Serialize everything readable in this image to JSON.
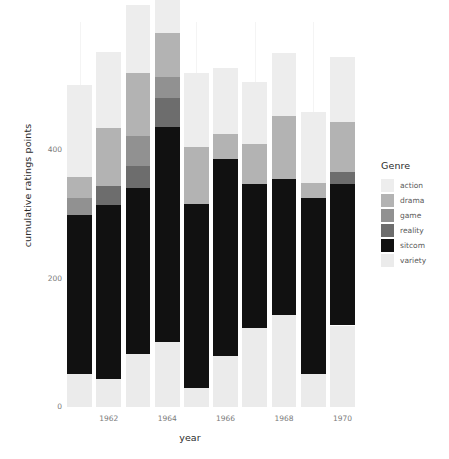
{
  "chart_data": {
    "type": "bar",
    "variant": "stacked",
    "title": "",
    "xlabel": "year",
    "ylabel": "cumulative ratings points",
    "x": [
      1961,
      1962,
      1963,
      1964,
      1965,
      1966,
      1967,
      1968,
      1969,
      1970
    ],
    "categories": [
      "1961",
      "1962",
      "1963",
      "1964",
      "1965",
      "1966",
      "1967",
      "1968",
      "1969",
      "1970"
    ],
    "xtick_labels": [
      "1962",
      "1964",
      "1966",
      "1968",
      "1970"
    ],
    "xtick_values": [
      1962,
      1964,
      1966,
      1968,
      1970
    ],
    "ytick_labels": [
      "0",
      "200",
      "400"
    ],
    "ytick_values": [
      0,
      200,
      400
    ],
    "ylim": [
      0,
      600
    ],
    "xlim": [
      1960.4,
      1970.6
    ],
    "grid": "vertical-minor-only",
    "legend_title": "Genre",
    "legend_position": "right",
    "stack_order_bottom_to_top": [
      "variety",
      "sitcom",
      "reality",
      "game",
      "drama",
      "action"
    ],
    "colors": {
      "action": "#ededed",
      "drama": "#b3b3b3",
      "game": "#919191",
      "reality": "#6d6d6d",
      "sitcom": "#111111",
      "variety": "#ebebeb"
    },
    "series": [
      {
        "name": "action",
        "values": [
          143,
          119,
          106,
          123,
          116,
          103,
          96,
          98,
          111,
          101
        ]
      },
      {
        "name": "drama",
        "values": [
          34,
          91,
          99,
          69,
          89,
          38,
          62,
          99,
          23,
          77
        ]
      },
      {
        "name": "game",
        "values": [
          26,
          0,
          46,
          32,
          0,
          0,
          0,
          0,
          0,
          0
        ]
      },
      {
        "name": "reality",
        "values": [
          0,
          29,
          34,
          46,
          0,
          0,
          0,
          0,
          0,
          20
        ]
      },
      {
        "name": "sitcom",
        "values": [
          247,
          271,
          260,
          335,
          286,
          308,
          225,
          212,
          275,
          220
        ]
      },
      {
        "name": "variety",
        "values": [
          52,
          44,
          82,
          101,
          30,
          79,
          123,
          143,
          51,
          127
        ]
      }
    ],
    "totals": [
      502,
      554,
      627,
      706,
      521,
      528,
      506,
      552,
      460,
      545
    ]
  },
  "legend": {
    "title": "Genre",
    "items": [
      {
        "label": "action",
        "color": "#ededed"
      },
      {
        "label": "drama",
        "color": "#b3b3b3"
      },
      {
        "label": "game",
        "color": "#919191"
      },
      {
        "label": "reality",
        "color": "#6d6d6d"
      },
      {
        "label": "sitcom",
        "color": "#111111"
      },
      {
        "label": "variety",
        "color": "#ebebeb"
      }
    ]
  },
  "axes": {
    "x_title": "year",
    "y_title": "cumulative ratings points"
  }
}
